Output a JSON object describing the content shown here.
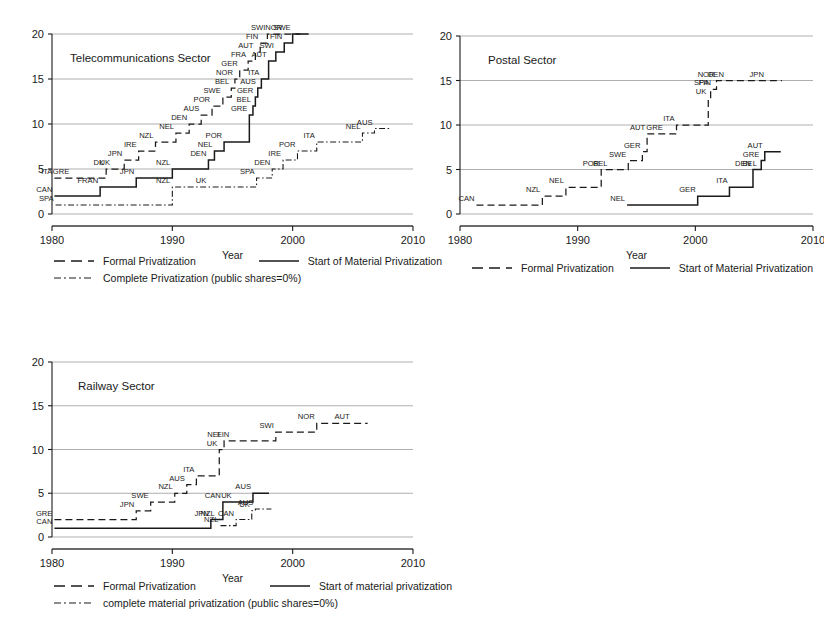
{
  "page": {
    "background": "#ffffff",
    "ink": "#1a1a1a",
    "grid_color": "#9a9a9a"
  },
  "axis": {
    "x_label": "Year",
    "x_ticks": [
      "1980",
      "1990",
      "2000",
      "2010"
    ],
    "y_ticks": [
      "0",
      "5",
      "10",
      "15",
      "20"
    ],
    "x_min": 1980,
    "x_max": 2010,
    "y_min": 0,
    "y_max": 20
  },
  "legends": {
    "telecom": {
      "formal": "Formal Privatization",
      "material": "Start of Material Privatization",
      "complete": "Complete Privatization (public shares=0%)"
    },
    "postal": {
      "formal": "Formal Privatization",
      "material": "Start of Material Privatization"
    },
    "railway": {
      "formal": "Formal Privatization",
      "material": "Start of material privatization",
      "complete": "complete material privatization (public shares=0%)"
    }
  },
  "chart_data": [
    {
      "id": "telecom",
      "type": "line",
      "title": "Telecommunications Sector",
      "xlabel": "Year",
      "ylabel": "",
      "xlim": [
        1980,
        2010
      ],
      "ylim": [
        0,
        20
      ],
      "grid": true,
      "legend_position": "below",
      "series": [
        {
          "name": "Formal Privatization",
          "style": "dashed",
          "steps": [
            {
              "x": 1980.2,
              "y": 4,
              "label": "ITA"
            },
            {
              "x": 1981.6,
              "y": 4,
              "label": "GRE"
            },
            {
              "x": 1984.5,
              "y": 5,
              "label": "DK"
            },
            {
              "x": 1985.0,
              "y": 5,
              "label": "UK"
            },
            {
              "x": 1986.0,
              "y": 6,
              "label": "JPN"
            },
            {
              "x": 1987.2,
              "y": 7,
              "label": "IRE"
            },
            {
              "x": 1988.6,
              "y": 8,
              "label": "NZL"
            },
            {
              "x": 1990.3,
              "y": 9,
              "label": "NEL"
            },
            {
              "x": 1991.4,
              "y": 10,
              "label": "DEN"
            },
            {
              "x": 1992.4,
              "y": 11,
              "label": "AUS"
            },
            {
              "x": 1993.3,
              "y": 12,
              "label": "POR"
            },
            {
              "x": 1994.2,
              "y": 13,
              "label": "SWE"
            },
            {
              "x": 1994.9,
              "y": 14,
              "label": "BEL"
            },
            {
              "x": 1995.2,
              "y": 15,
              "label": "NOR"
            },
            {
              "x": 1995.6,
              "y": 16,
              "label": "GER"
            },
            {
              "x": 1996.3,
              "y": 17,
              "label": "FRA"
            },
            {
              "x": 1996.9,
              "y": 18,
              "label": "AUT"
            },
            {
              "x": 1997.3,
              "y": 19,
              "label": "FIN"
            },
            {
              "x": 1997.9,
              "y": 20,
              "label": "SWI"
            },
            {
              "x": 1999.3,
              "y": 20,
              "label": "NOR"
            }
          ]
        },
        {
          "name": "Start of Material Privatization",
          "style": "solid",
          "steps": [
            {
              "x": 1980.2,
              "y": 2,
              "label": "CAN"
            },
            {
              "x": 1984.0,
              "y": 3,
              "label": "FRAN"
            },
            {
              "x": 1987.0,
              "y": 4,
              "label": "JPN"
            },
            {
              "x": 1990.0,
              "y": 5,
              "label": "NZL"
            },
            {
              "x": 1993.0,
              "y": 6,
              "label": "DEN"
            },
            {
              "x": 1993.5,
              "y": 7,
              "label": "NEL"
            },
            {
              "x": 1994.3,
              "y": 8,
              "label": "POR"
            },
            {
              "x": 1996.4,
              "y": 11,
              "label": "GRE"
            },
            {
              "x": 1996.7,
              "y": 12,
              "label": "BEL"
            },
            {
              "x": 1996.9,
              "y": 13,
              "label": "GER"
            },
            {
              "x": 1997.1,
              "y": 14,
              "label": "AUS"
            },
            {
              "x": 1997.4,
              "y": 15,
              "label": "ITA"
            },
            {
              "x": 1998.0,
              "y": 17,
              "label": "AUT"
            },
            {
              "x": 1998.6,
              "y": 18,
              "label": "SWI"
            },
            {
              "x": 1999.3,
              "y": 19,
              "label": "FIN"
            },
            {
              "x": 2000.0,
              "y": 20,
              "label": "SWE"
            }
          ]
        },
        {
          "name": "Complete Privatization (public shares=0%)",
          "style": "dashdot",
          "steps": [
            {
              "x": 1980.3,
              "y": 1,
              "label": "SPA"
            },
            {
              "x": 1990.0,
              "y": 3,
              "label": "NZL"
            },
            {
              "x": 1993.0,
              "y": 3,
              "label": "UK"
            },
            {
              "x": 1997.0,
              "y": 4,
              "label": "SPA"
            },
            {
              "x": 1998.3,
              "y": 5,
              "label": "DEN"
            },
            {
              "x": 1999.2,
              "y": 6,
              "label": "IRE"
            },
            {
              "x": 2000.4,
              "y": 7,
              "label": "POR"
            },
            {
              "x": 2002.0,
              "y": 8,
              "label": "ITA"
            },
            {
              "x": 2005.8,
              "y": 9,
              "label": "NEL"
            },
            {
              "x": 2006.8,
              "y": 9.5,
              "label": "AUS"
            }
          ]
        }
      ]
    },
    {
      "id": "postal",
      "type": "line",
      "title": "Postal Sector",
      "xlabel": "Year",
      "ylabel": "",
      "xlim": [
        1980,
        2010
      ],
      "ylim": [
        0,
        20
      ],
      "grid": true,
      "legend_position": "below",
      "series": [
        {
          "name": "Formal Privatization",
          "style": "dashed",
          "steps": [
            {
              "x": 1981.4,
              "y": 1,
              "label": "CAN"
            },
            {
              "x": 1987.0,
              "y": 2,
              "label": "NZL"
            },
            {
              "x": 1989.0,
              "y": 3,
              "label": "NEL"
            },
            {
              "x": 1992.0,
              "y": 5,
              "label": "POR"
            },
            {
              "x": 1992.7,
              "y": 5,
              "label": "BEL"
            },
            {
              "x": 1994.3,
              "y": 6,
              "label": "SWE"
            },
            {
              "x": 1995.5,
              "y": 7,
              "label": "GER"
            },
            {
              "x": 1995.9,
              "y": 9,
              "label": "AUT"
            },
            {
              "x": 1997.4,
              "y": 9,
              "label": "GRE"
            },
            {
              "x": 1998.4,
              "y": 10,
              "label": "ITA"
            },
            {
              "x": 2001.1,
              "y": 13,
              "label": "UK"
            },
            {
              "x": 2001.3,
              "y": 14,
              "label": "SPA"
            },
            {
              "x": 2001.5,
              "y": 14,
              "label": "FIN"
            },
            {
              "x": 2001.8,
              "y": 15,
              "label": "NOR"
            },
            {
              "x": 2002.6,
              "y": 15,
              "label": "DEN"
            },
            {
              "x": 2006.0,
              "y": 15,
              "label": "JPN"
            }
          ]
        },
        {
          "name": "Start of Material Privatization",
          "style": "solid",
          "steps": [
            {
              "x": 1994.2,
              "y": 1,
              "label": "NEL"
            },
            {
              "x": 2000.2,
              "y": 2,
              "label": "GER"
            },
            {
              "x": 2002.9,
              "y": 3,
              "label": "ITA"
            },
            {
              "x": 2004.9,
              "y": 5,
              "label": "DEN"
            },
            {
              "x": 2005.4,
              "y": 5,
              "label": "BEL"
            },
            {
              "x": 2005.6,
              "y": 6,
              "label": "GRE"
            },
            {
              "x": 2005.9,
              "y": 7,
              "label": "AUT"
            }
          ]
        }
      ]
    },
    {
      "id": "railway",
      "type": "line",
      "title": "Railway Sector",
      "xlabel": "Year",
      "ylabel": "",
      "xlim": [
        1980,
        2010
      ],
      "ylim": [
        0,
        20
      ],
      "grid": true,
      "legend_position": "below",
      "series": [
        {
          "name": "Formal Privatization",
          "style": "dashed",
          "steps": [
            {
              "x": 1980.2,
              "y": 2,
              "label": "GRE"
            },
            {
              "x": 1987.0,
              "y": 3,
              "label": "JPN"
            },
            {
              "x": 1988.2,
              "y": 4,
              "label": "SWE"
            },
            {
              "x": 1990.2,
              "y": 5,
              "label": "NZL"
            },
            {
              "x": 1991.2,
              "y": 6,
              "label": "AUS"
            },
            {
              "x": 1992.0,
              "y": 7,
              "label": "ITA"
            },
            {
              "x": 1993.9,
              "y": 10,
              "label": "UK"
            },
            {
              "x": 1994.3,
              "y": 11,
              "label": "NEL"
            },
            {
              "x": 1994.9,
              "y": 11,
              "label": "FIN"
            },
            {
              "x": 1998.6,
              "y": 12,
              "label": "SWI"
            },
            {
              "x": 2002.0,
              "y": 13,
              "label": "NOR"
            },
            {
              "x": 2004.9,
              "y": 13,
              "label": "AUT"
            }
          ]
        },
        {
          "name": "Start of material privatization",
          "style": "solid",
          "steps": [
            {
              "x": 1980.2,
              "y": 1,
              "label": "CAN"
            },
            {
              "x": 1993.2,
              "y": 2,
              "label": "JPN"
            },
            {
              "x": 1993.7,
              "y": 2,
              "label": "NZL"
            },
            {
              "x": 1994.2,
              "y": 4,
              "label": "CAN"
            },
            {
              "x": 1995.1,
              "y": 4,
              "label": "UK"
            },
            {
              "x": 1996.7,
              "y": 5,
              "label": "AUS"
            }
          ]
        },
        {
          "name": "complete material privatization (public shares=0%)",
          "style": "dashdot",
          "steps": [
            {
              "x": 1994.0,
              "y": 1.3,
              "label": "NZL"
            },
            {
              "x": 1995.3,
              "y": 2,
              "label": "CAN"
            },
            {
              "x": 1996.6,
              "y": 3,
              "label": "UK"
            },
            {
              "x": 1996.9,
              "y": 3.2,
              "label": "AUS"
            }
          ]
        }
      ]
    }
  ]
}
